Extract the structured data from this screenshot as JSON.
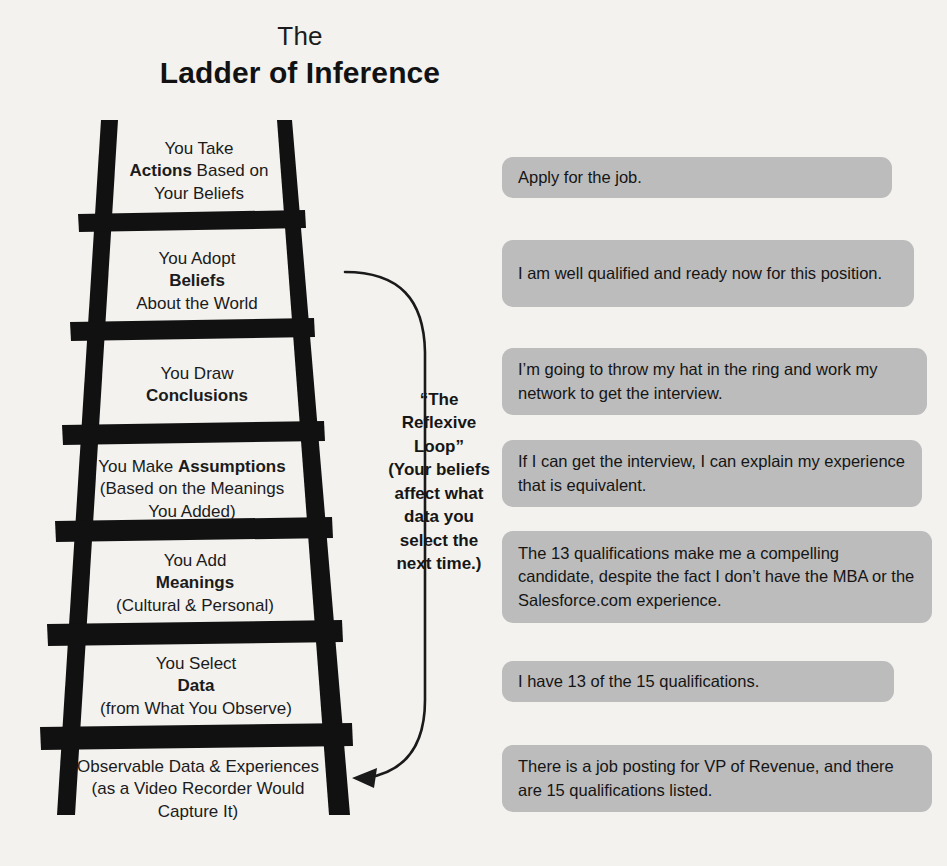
{
  "title": {
    "line1": "The",
    "line2": "Ladder of Inference"
  },
  "ladder": {
    "rungs": [
      {
        "id": "actions",
        "line1": "You Take",
        "line2_bold": "Actions",
        "line2_rest": " Based on",
        "line3": "Your Beliefs"
      },
      {
        "id": "beliefs",
        "line1": "You Adopt",
        "line2_bold": "Beliefs",
        "line2_rest": "",
        "line3": "About the World"
      },
      {
        "id": "conclusions",
        "line1": "You Draw",
        "line2_bold": "Conclusions",
        "line2_rest": "",
        "line3": ""
      },
      {
        "id": "assumptions",
        "line1_pre": "You Make ",
        "line1_bold": "Assumptions",
        "line2": "(Based on the Meanings",
        "line3": "You Added)"
      },
      {
        "id": "meanings",
        "line1": "You Add",
        "line2_bold": "Meanings",
        "line2_rest": "",
        "line3": "(Cultural & Personal)"
      },
      {
        "id": "data",
        "line1": "You Select",
        "line2_bold": "Data",
        "line2_rest": "",
        "line3": "(from What You Observe)"
      },
      {
        "id": "observable-data",
        "line1": "Observable Data & Experiences",
        "line2": "(as a Video Recorder Would",
        "line3": "Capture It)"
      }
    ]
  },
  "reflexive_loop": {
    "heading_line1": "“The",
    "heading_line2": "Reflexive",
    "heading_line3": "Loop”",
    "body_line1": "(Your beliefs",
    "body_line2": "affect what",
    "body_line3": "data you",
    "body_line4": "select the",
    "body_line5": "next time.)",
    "arrow_icon": "curved-arrow-down-left-icon"
  },
  "examples": [
    {
      "id": "example-actions",
      "text": "Apply for the job."
    },
    {
      "id": "example-beliefs",
      "text": "I am well qualified and ready now for this position."
    },
    {
      "id": "example-conclusions",
      "text": "I’m going to throw my hat in the ring and work my network to get the interview."
    },
    {
      "id": "example-assumptions",
      "text": "If I can get the interview, I can explain my experience that is equivalent."
    },
    {
      "id": "example-meanings",
      "text": "The 13 qualifications make me a compelling candidate, despite the fact I don’t have the MBA or the Salesforce.com experience."
    },
    {
      "id": "example-data",
      "text": "I have 13 of the 15 qualifications."
    },
    {
      "id": "example-observable-data",
      "text": "There is a job posting for VP of Revenue, and there are 15 qualifications listed."
    }
  ],
  "colors": {
    "background": "#f3f2ef",
    "ladder": "#111111",
    "box_fill": "#bcbcbc",
    "text": "#1a1a1a"
  }
}
